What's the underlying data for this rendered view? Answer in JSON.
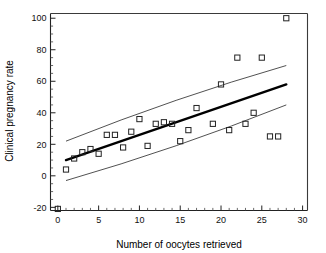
{
  "chart_data": {
    "type": "scatter",
    "title": "",
    "xlabel": "Number of oocytes retrieved",
    "ylabel": "Clinical pregnancy rate",
    "xlim": [
      -0.9,
      30.6
    ],
    "ylim": [
      -22,
      103
    ],
    "xticks": [
      0,
      5,
      10,
      15,
      20,
      25,
      30
    ],
    "xticklabels": [
      "0",
      "5",
      "10",
      "15",
      "20",
      "25",
      "30"
    ],
    "yticks": [
      -20,
      0,
      20,
      40,
      60,
      80,
      100
    ],
    "yticklabels": [
      "-20",
      "0",
      "20",
      "40",
      "60",
      "80",
      "100"
    ],
    "x_minor_tick_step": 1,
    "y_minor_tick_step": 5,
    "grid": false,
    "legend": "none",
    "marker": "open-square",
    "points": [
      {
        "x": 0,
        "y": -21
      },
      {
        "x": 1,
        "y": 4
      },
      {
        "x": 2,
        "y": 11
      },
      {
        "x": 3,
        "y": 15
      },
      {
        "x": 4,
        "y": 17
      },
      {
        "x": 5,
        "y": 14
      },
      {
        "x": 6,
        "y": 26
      },
      {
        "x": 7,
        "y": 26
      },
      {
        "x": 8,
        "y": 18
      },
      {
        "x": 9,
        "y": 28
      },
      {
        "x": 10,
        "y": 36
      },
      {
        "x": 11,
        "y": 19
      },
      {
        "x": 12,
        "y": 33
      },
      {
        "x": 13,
        "y": 34
      },
      {
        "x": 14,
        "y": 33
      },
      {
        "x": 15,
        "y": 22
      },
      {
        "x": 16,
        "y": 29
      },
      {
        "x": 17,
        "y": 43
      },
      {
        "x": 19,
        "y": 33
      },
      {
        "x": 20,
        "y": 58
      },
      {
        "x": 21,
        "y": 29
      },
      {
        "x": 22,
        "y": 75
      },
      {
        "x": 23,
        "y": 33
      },
      {
        "x": 24,
        "y": 40
      },
      {
        "x": 25,
        "y": 75
      },
      {
        "x": 26,
        "y": 25
      },
      {
        "x": 27,
        "y": 25
      },
      {
        "x": 28,
        "y": 100
      }
    ],
    "series": [
      {
        "name": "regression-line",
        "type": "line",
        "style": "thick-solid",
        "x": [
          1,
          28
        ],
        "y": [
          10,
          58
        ]
      },
      {
        "name": "upper-confidence-band",
        "type": "line",
        "style": "thin-solid",
        "x": [
          1,
          28
        ],
        "y": [
          22,
          70
        ]
      },
      {
        "name": "lower-confidence-band",
        "type": "line",
        "style": "thin-solid",
        "x": [
          1,
          28
        ],
        "y": [
          -3,
          45
        ]
      }
    ]
  },
  "figure": {
    "background_color": "#ffffff",
    "axis_color": "#222222",
    "marker_color": "#222222",
    "fitline_color": "#000000",
    "band_color": "#3d3d3d"
  }
}
